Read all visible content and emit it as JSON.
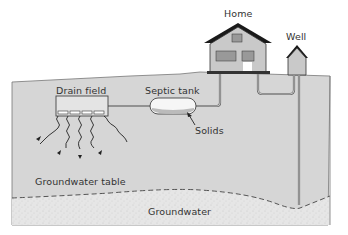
{
  "labels": {
    "home": "Home",
    "well": "Well",
    "drain_field": "Drain field",
    "septic_tank": "Septic tank",
    "solids": "Solids",
    "groundwater_table": "Groundwater table",
    "groundwater": "Groundwater"
  },
  "colors": {
    "soil": "#d4d4d4",
    "groundwater": "#e2e2e2",
    "outline": "#555555",
    "roof": "#1a1a1a",
    "house_wall": "#c8c8c8",
    "tank": "#f4f4f4"
  }
}
